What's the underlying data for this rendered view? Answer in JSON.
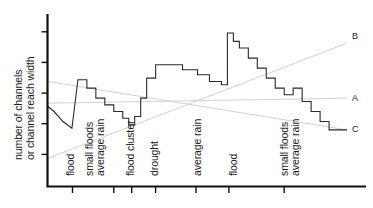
{
  "chart_data": {
    "type": "line",
    "title": "",
    "ylabel": "number of channels\nor channel reach width",
    "ylabel_lines": [
      "number of channels",
      "or channel reach width"
    ],
    "xlabel": "",
    "grid": false,
    "legend_position": "right-inline",
    "xlim": [
      0,
      100
    ],
    "ylim": [
      0,
      100
    ],
    "x_axis_ticks_values": [
      8.2,
      22.0,
      28.0,
      36.0,
      49.5,
      60.5,
      79.0
    ],
    "annotations": [
      {
        "label": "flood",
        "x": 8.2,
        "rotated": true
      },
      {
        "label": "small floods\naverage rain",
        "x": 15.5,
        "rotated": true
      },
      {
        "label": "flood cluster",
        "x": 29.5,
        "rotated": true
      },
      {
        "label": "drought",
        "x": 37.5,
        "rotated": true
      },
      {
        "label": "average rain",
        "x": 52.5,
        "rotated": true
      },
      {
        "label": "flood",
        "x": 60.5,
        "rotated": true
      },
      {
        "label": "small floods\naverage rain",
        "x": 77.5,
        "rotated": true
      }
    ],
    "series": [
      {
        "name": "channel response",
        "type": "step",
        "color": "#2b2b2b",
        "x": [
          0,
          2,
          5,
          8,
          8,
          10,
          13,
          13,
          16,
          16,
          19,
          19,
          22,
          22,
          25,
          25,
          27,
          27,
          29,
          29,
          31,
          31,
          33,
          33,
          36,
          36,
          39,
          39,
          45,
          45,
          50,
          50,
          54,
          54,
          58,
          58,
          60,
          60,
          62,
          62,
          64,
          64,
          67,
          67,
          70,
          70,
          73,
          73,
          76,
          76,
          79,
          79,
          82,
          82,
          85,
          85,
          88,
          88,
          91,
          91,
          94,
          94,
          97,
          100
        ],
        "y": [
          47,
          44,
          38,
          34,
          34,
          63,
          63,
          58,
          58,
          52,
          52,
          48,
          48,
          44,
          44,
          40,
          40,
          36,
          36,
          41,
          41,
          52,
          52,
          64,
          64,
          72,
          72,
          72,
          72,
          69,
          69,
          66,
          66,
          62,
          62,
          60,
          60,
          91,
          91,
          86,
          86,
          82,
          82,
          76,
          76,
          70,
          70,
          64,
          64,
          58,
          58,
          54,
          54,
          58,
          58,
          50,
          50,
          44,
          44,
          38,
          38,
          33,
          33,
          33
        ]
      },
      {
        "name": "A",
        "type": "trend",
        "color": "#d2d2d2",
        "label": "A",
        "x": [
          0,
          100
        ],
        "y": [
          49,
          52
        ]
      },
      {
        "name": "B",
        "type": "trend",
        "color": "#d2d2d2",
        "label": "B",
        "x": [
          0,
          100
        ],
        "y": [
          16,
          85
        ]
      },
      {
        "name": "C",
        "type": "trend",
        "color": "#d2d2d2",
        "label": "C",
        "x": [
          0,
          100
        ],
        "y": [
          62,
          33
        ]
      }
    ],
    "legend_labels": [
      "A",
      "B",
      "C"
    ]
  },
  "axis": {
    "y_tick_count": 5,
    "y_label_line1": "number of channels",
    "y_label_line2": "or channel reach width"
  },
  "events": {
    "e1": "flood",
    "e2a": "small floods",
    "e2b": "average rain",
    "e3": "flood cluster",
    "e4": "drought",
    "e5": "average rain",
    "e6": "flood",
    "e7a": "small floods",
    "e7b": "average rain"
  },
  "series_labels": {
    "a": "A",
    "b": "B",
    "c": "C"
  }
}
